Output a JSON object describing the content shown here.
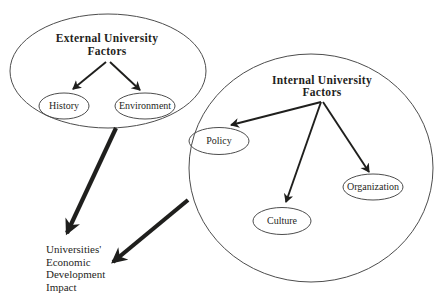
{
  "colors": {
    "ink": "#1f1f1d",
    "outline": "#4d4d4d",
    "background": "#ffffff"
  },
  "diagram": {
    "external_group": {
      "title_line1": "External University",
      "title_line2": "Factors",
      "nodes": {
        "history": "History",
        "environment": "Environment"
      }
    },
    "internal_group": {
      "title_line1": "Internal University",
      "title_line2": "Factors",
      "nodes": {
        "policy": "Policy",
        "culture": "Culture",
        "organization": "Organization"
      }
    },
    "impact": {
      "lines": [
        "Universities'",
        "Economic",
        "Development",
        "Impact"
      ]
    }
  }
}
